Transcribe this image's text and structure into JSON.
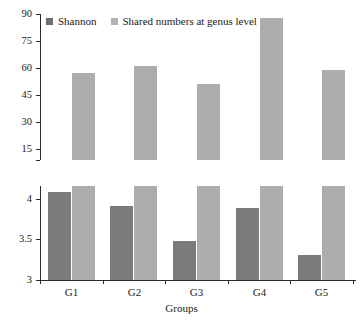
{
  "chart_data": {
    "type": "bar",
    "title": "",
    "xlabel": "Groups",
    "ylabel": "",
    "categories": [
      "G1",
      "G2",
      "G3",
      "G4",
      "G5"
    ],
    "series": [
      {
        "name": "Shannon",
        "color": "#7b7b7b",
        "values": [
          4.08,
          3.91,
          3.48,
          3.89,
          3.31
        ],
        "axis": "bottom",
        "axis_range": [
          3,
          4.15
        ]
      },
      {
        "name": "Shared numbers at genus level",
        "color": "#adadad",
        "values": [
          57,
          61,
          51,
          88,
          59
        ],
        "axis": "top",
        "axis_range": [
          0,
          90
        ]
      }
    ],
    "broken_axis": true,
    "panels": [
      {
        "name": "upper",
        "series_shown": [
          "Shared numbers at genus level"
        ],
        "ylim": [
          0,
          90
        ],
        "yticks": [
          15,
          30,
          45,
          60,
          75,
          90
        ],
        "ytick_labels": [
          "15",
          "30",
          "45",
          "60",
          "75",
          "90"
        ]
      },
      {
        "name": "lower",
        "series_shown": [
          "Shannon",
          "Shared numbers at genus level"
        ],
        "ylim": [
          3,
          4.15
        ],
        "yticks": [
          3,
          3.5,
          4
        ],
        "ytick_labels": [
          "3",
          "3.5",
          "4"
        ]
      }
    ],
    "grid": false,
    "legend_position": "top-left"
  },
  "legend": {
    "items": [
      {
        "label": "Shannon",
        "swatch": "dark-swatch"
      },
      {
        "label": "Shared numbers at genus level",
        "swatch": "light-swatch"
      }
    ]
  },
  "axes": {
    "top_ticks": [
      "90",
      "75",
      "60",
      "45",
      "30",
      "15"
    ],
    "bottom_ticks": [
      "4",
      "3.5",
      "3"
    ],
    "x_labels": [
      "G1",
      "G2",
      "G3",
      "G4",
      "G5"
    ],
    "x_title": "Groups"
  },
  "caption": ""
}
